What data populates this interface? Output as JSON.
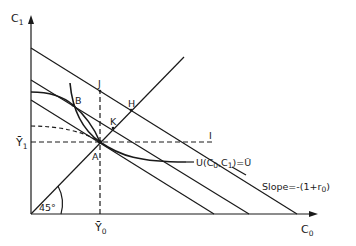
{
  "diagram": {
    "axes": {
      "y_label": "C",
      "y_label_sub": "1",
      "x_label": "C",
      "x_label_sub": "0"
    },
    "ticks": {
      "y_tick": "Ȳ",
      "y_tick_sub": "1",
      "x_tick": "Ȳ",
      "x_tick_sub": "0"
    },
    "points": {
      "A": "A",
      "B": "B",
      "H": "H",
      "J": "J",
      "K": "K",
      "I": "I"
    },
    "angle_label": "45°",
    "indifference_curve_label": {
      "prefix": "U(C",
      "sub0": "0",
      "mid": ",C",
      "sub1": "1",
      "suffix": ")=Ū"
    },
    "slope_label": {
      "prefix": "Slope=-(1+r",
      "sub": "0",
      "suffix": ")"
    },
    "colors": {
      "line": "#1a1a1a",
      "background": "#ffffff"
    }
  }
}
